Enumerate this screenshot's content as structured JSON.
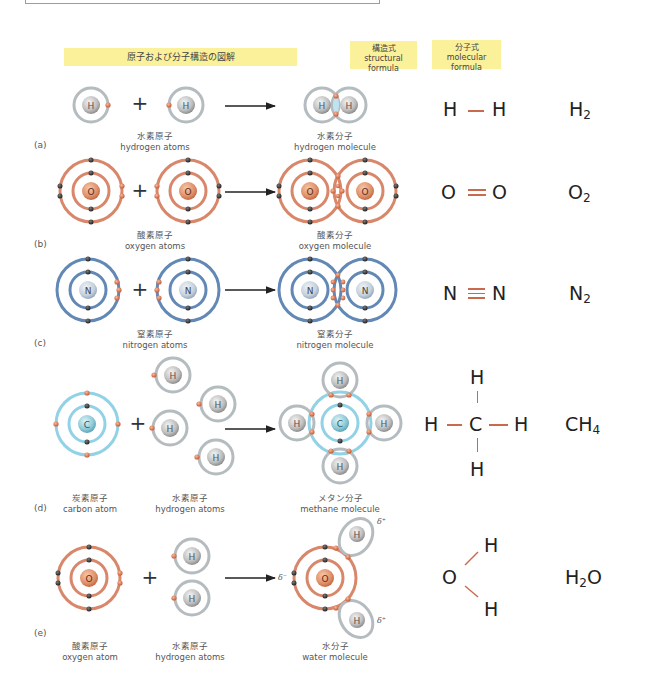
{
  "headers": {
    "diagram": "原子および分子構造の図解",
    "structural_jp": "構造式",
    "structural_en": "structural formula",
    "molecular_jp": "分子式",
    "molecular_en": "molecular formula"
  },
  "colors": {
    "header_bg": "#fbf19a",
    "hydrogen_orbit": "#aab3b8",
    "oxygen_orbit": "#d47e5e",
    "nitrogen_orbit": "#5d84b4",
    "carbon_orbit": "#8fd0e4",
    "shared_electron": "#d9744e",
    "bond_line": "#c96a4e"
  },
  "rows": [
    {
      "label": "(a)",
      "reactant_jp": "水素原子",
      "reactant_en": "hydrogen atoms",
      "product_jp": "水素分子",
      "product_en": "hydrogen molecule",
      "structural": [
        "H",
        "H"
      ],
      "bond": "single",
      "molecular": {
        "symbol": "H",
        "sub": "2",
        "tail": ""
      }
    },
    {
      "label": "(b)",
      "reactant_jp": "酸素原子",
      "reactant_en": "oxygen atoms",
      "product_jp": "酸素分子",
      "product_en": "oxygen molecule",
      "structural": [
        "O",
        "O"
      ],
      "bond": "double",
      "molecular": {
        "symbol": "O",
        "sub": "2",
        "tail": ""
      }
    },
    {
      "label": "(c)",
      "reactant_jp": "窒素原子",
      "reactant_en": "nitrogen atoms",
      "product_jp": "窒素分子",
      "product_en": "nitrogen molecule",
      "structural": [
        "N",
        "N"
      ],
      "bond": "triple",
      "molecular": {
        "symbol": "N",
        "sub": "2",
        "tail": ""
      }
    },
    {
      "label": "(d)",
      "reactant1_jp": "炭素原子",
      "reactant1_en": "carbon atom",
      "reactant2_jp": "水素原子",
      "reactant2_en": "hydrogen atoms",
      "product_jp": "メタン分子",
      "product_en": "methane molecule",
      "structural": {
        "center": "C",
        "top": "H",
        "bottom": "H",
        "left": "H",
        "right": "H"
      },
      "molecular": {
        "symbol": "CH",
        "sub": "4",
        "tail": ""
      }
    },
    {
      "label": "(e)",
      "reactant1_jp": "酸素原子",
      "reactant1_en": "oxygen atom",
      "reactant2_jp": "水素原子",
      "reactant2_en": "hydrogen atoms",
      "product_jp": "水分子",
      "product_en": "water molecule",
      "structural": {
        "center": "O",
        "upper": "H",
        "lower": "H"
      },
      "molecular": {
        "symbol": "H",
        "sub": "2",
        "tail": "O"
      },
      "partial_charges": {
        "oxygen": "δ⁻",
        "hydrogen_top": "δ⁺",
        "hydrogen_bottom": "δ⁺"
      }
    }
  ],
  "nucleus_labels": {
    "H": "H",
    "O": "O",
    "N": "N",
    "C": "C"
  },
  "operators": {
    "plus": "+"
  }
}
